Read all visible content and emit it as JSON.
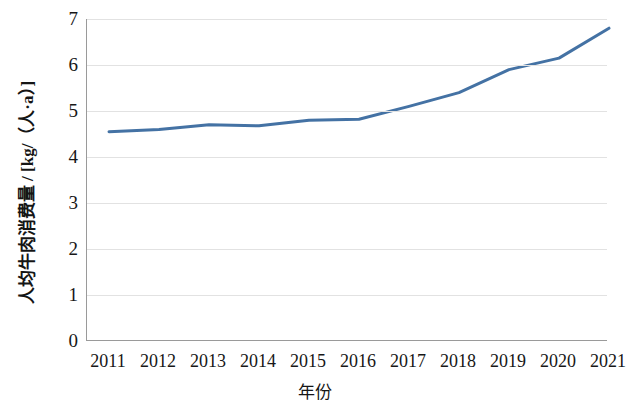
{
  "chart_data": {
    "type": "line",
    "title": "",
    "xlabel": "年份",
    "ylabel": "人均牛肉消费量 / [kg/（人·a）]",
    "categories": [
      "2011",
      "2012",
      "2013",
      "2014",
      "2015",
      "2016",
      "2017",
      "2018",
      "2019",
      "2020",
      "2021"
    ],
    "x": [
      2011,
      2012,
      2013,
      2014,
      2015,
      2016,
      2017,
      2018,
      2019,
      2020,
      2021
    ],
    "values": [
      4.55,
      4.6,
      4.7,
      4.68,
      4.8,
      4.82,
      5.1,
      5.4,
      5.9,
      6.15,
      6.8
    ],
    "series": [
      {
        "name": "人均牛肉消费量",
        "values": [
          4.55,
          4.6,
          4.7,
          4.68,
          4.8,
          4.82,
          5.1,
          5.4,
          5.9,
          6.15,
          6.8
        ]
      }
    ],
    "ylim": [
      0,
      7
    ],
    "yticks": [
      0,
      1,
      2,
      3,
      4,
      5,
      6,
      7
    ],
    "ytick_labels": [
      "0",
      "1",
      "2",
      "3",
      "4",
      "5",
      "6",
      "7"
    ],
    "xlim": [
      2011,
      2021
    ],
    "grid": "horizontal",
    "legend": "none",
    "line_color": "#4472A4",
    "line_width": 3,
    "markers": "none",
    "grid_color": "#E2E2E2",
    "axis_color": "#9A9A9A",
    "background": "#FFFFFF"
  }
}
